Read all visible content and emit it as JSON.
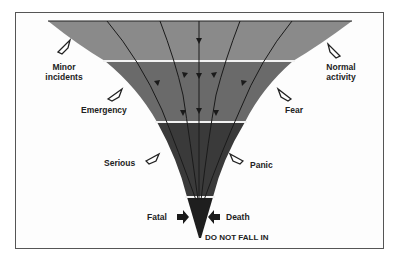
{
  "diagram": {
    "type": "funnel",
    "colors": {
      "band1": "#8a8a8a",
      "band2": "#6a6a6a",
      "band3": "#3a3a3a",
      "band4": "#1e1e1e",
      "divider": "#f2f2f2",
      "flow_line": "#1a1a1a"
    },
    "left_labels": [
      {
        "id": "minor",
        "lines": [
          "Minor",
          "incidents"
        ],
        "arrow": "hollow"
      },
      {
        "id": "emergency",
        "lines": [
          "Emergency"
        ],
        "arrow": "hollow"
      },
      {
        "id": "serious",
        "lines": [
          "Serious"
        ],
        "arrow": "hollow"
      },
      {
        "id": "fatal",
        "lines": [
          "Fatal"
        ],
        "arrow": "solid"
      }
    ],
    "right_labels": [
      {
        "id": "normal",
        "lines": [
          "Normal",
          "activity"
        ],
        "arrow": "hollow"
      },
      {
        "id": "fear",
        "lines": [
          "Fear"
        ],
        "arrow": "hollow"
      },
      {
        "id": "panic",
        "lines": [
          "Panic"
        ],
        "arrow": "hollow"
      },
      {
        "id": "death",
        "lines": [
          "Death"
        ],
        "arrow": "solid"
      }
    ],
    "bottom_caption": "DO NOT FALL IN"
  }
}
